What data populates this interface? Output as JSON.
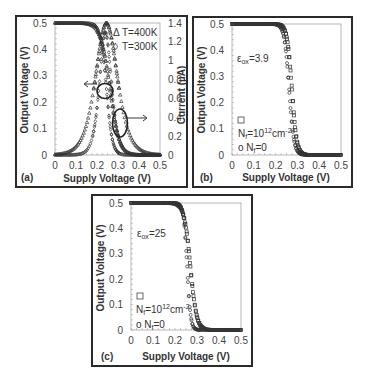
{
  "chart_data": [
    {
      "id": "a",
      "type": "line",
      "panel_label": "(a)",
      "xlabel": "Supply Voltage (V)",
      "ylabel": "Output Voltage (V)",
      "y2label": "Current (µA)",
      "xlim": [
        0,
        0.5
      ],
      "ylim": [
        0,
        0.5
      ],
      "y2lim": [
        0,
        1.4
      ],
      "xticks": [
        "0",
        "0.1",
        "0.2",
        "0.3",
        "0.4",
        "0.5"
      ],
      "yticks": [
        "0",
        "0.1",
        "0.2",
        "0.3",
        "0.4",
        "0.5"
      ],
      "y2ticks": [
        "0",
        "0.2",
        "0.4",
        "0.6",
        "0.8",
        "1",
        "1.2",
        "1.4"
      ],
      "grid": false,
      "legend": [
        {
          "marker": "Δ",
          "label": "T=400K"
        },
        {
          "marker": "◊",
          "label": "T=300K"
        }
      ],
      "annotations": [
        {
          "type": "circle",
          "target": "output voltage curves",
          "arrow": "left",
          "axis": "left"
        },
        {
          "type": "ellipse",
          "target": "current curves",
          "arrow": "right",
          "axis": "right"
        }
      ],
      "series": [
        {
          "name": "Vout T=400K",
          "axis": "left",
          "marker": "triangle",
          "kind": "sigmoid",
          "v_high": 0.5,
          "v_mid": 0.262,
          "width": 0.022
        },
        {
          "name": "Vout T=300K",
          "axis": "left",
          "marker": "diamond",
          "kind": "sigmoid",
          "v_high": 0.5,
          "v_mid": 0.245,
          "width": 0.014
        },
        {
          "name": "Current T=400K",
          "axis": "right",
          "marker": "triangle",
          "kind": "peak",
          "peak": 1.4,
          "center": 0.245,
          "width": 0.055
        },
        {
          "name": "Current T=300K",
          "axis": "right",
          "marker": "diamond",
          "kind": "peak",
          "peak": 1.3,
          "center": 0.24,
          "width": 0.03
        }
      ],
      "x": [
        0,
        0.05,
        0.1,
        0.15,
        0.2,
        0.22,
        0.24,
        0.26,
        0.28,
        0.3,
        0.35,
        0.4,
        0.45,
        0.5
      ],
      "approx_values": {
        "Vout_400K": [
          0.5,
          0.5,
          0.5,
          0.49,
          0.45,
          0.42,
          0.33,
          0.25,
          0.17,
          0.11,
          0.04,
          0.01,
          0.0,
          0.0
        ],
        "Vout_300K": [
          0.5,
          0.5,
          0.5,
          0.5,
          0.47,
          0.42,
          0.28,
          0.12,
          0.05,
          0.02,
          0.0,
          0.0,
          0.0,
          0.0
        ],
        "I_400K": [
          0.0,
          0.02,
          0.08,
          0.25,
          0.75,
          1.05,
          1.38,
          1.3,
          0.95,
          0.6,
          0.2,
          0.06,
          0.02,
          0.0
        ],
        "I_300K": [
          0.0,
          0.0,
          0.01,
          0.05,
          0.4,
          0.8,
          1.3,
          1.05,
          0.45,
          0.18,
          0.03,
          0.0,
          0.0,
          0.0
        ]
      }
    },
    {
      "id": "b",
      "type": "line",
      "panel_label": "(b)",
      "xlabel": "Supply Voltage (V)",
      "ylabel": "Output Voltage (V)",
      "xlim": [
        0,
        0.5
      ],
      "ylim": [
        0,
        0.5
      ],
      "xticks": [
        "0",
        "0.1",
        "0.2",
        "0.3",
        "0.4",
        "0.5"
      ],
      "yticks": [
        "0",
        "0.1",
        "0.2",
        "0.3",
        "0.4",
        "0.5"
      ],
      "grid": false,
      "annotation_text": "εox=3.9",
      "legend": [
        {
          "marker": "□",
          "label": "Nf=10^12cm^-2"
        },
        {
          "marker": "o",
          "label": "Nf=0"
        }
      ],
      "series": [
        {
          "name": "Nf=1e12 cm^-2",
          "marker": "square",
          "kind": "sigmoid",
          "v_high": 0.5,
          "v_mid": 0.275,
          "width": 0.011
        },
        {
          "name": "Nf=0",
          "marker": "circle",
          "kind": "sigmoid",
          "v_high": 0.5,
          "v_mid": 0.262,
          "width": 0.011
        }
      ],
      "x": [
        0,
        0.1,
        0.2,
        0.22,
        0.24,
        0.26,
        0.28,
        0.3,
        0.35,
        0.4,
        0.5
      ],
      "approx_values": {
        "Nf_1e12": [
          0.5,
          0.5,
          0.5,
          0.49,
          0.47,
          0.41,
          0.24,
          0.07,
          0.01,
          0.0,
          0.0
        ],
        "Nf_0": [
          0.5,
          0.5,
          0.5,
          0.49,
          0.45,
          0.27,
          0.1,
          0.03,
          0.0,
          0.0,
          0.0
        ]
      }
    },
    {
      "id": "c",
      "type": "line",
      "panel_label": "(c)",
      "xlabel": "Supply Voltage (V)",
      "ylabel": "Output Voltage (V)",
      "xlim": [
        0,
        0.5
      ],
      "ylim": [
        0,
        0.5
      ],
      "xticks": [
        "0",
        "0.1",
        "0.2",
        "0.3",
        "0.4",
        "0.5"
      ],
      "yticks": [
        "0",
        "0.1",
        "0.2",
        "0.3",
        "0.4",
        "0.5"
      ],
      "grid": false,
      "annotation_text": "εox=25",
      "legend": [
        {
          "marker": "□",
          "label": "Nf=10^12cm^-2"
        },
        {
          "marker": "o",
          "label": "Nf=0"
        }
      ],
      "series": [
        {
          "name": "Nf=1e12 cm^-2",
          "marker": "square",
          "kind": "sigmoid",
          "v_high": 0.5,
          "v_mid": 0.27,
          "width": 0.014
        },
        {
          "name": "Nf=0",
          "marker": "circle",
          "kind": "sigmoid",
          "v_high": 0.5,
          "v_mid": 0.255,
          "width": 0.008
        }
      ],
      "x": [
        0,
        0.1,
        0.2,
        0.22,
        0.24,
        0.26,
        0.28,
        0.3,
        0.32,
        0.35,
        0.5
      ],
      "approx_values": {
        "Nf_1e12": [
          0.5,
          0.5,
          0.5,
          0.49,
          0.47,
          0.42,
          0.3,
          0.12,
          0.04,
          0.01,
          0.0
        ],
        "Nf_0": [
          0.5,
          0.5,
          0.5,
          0.49,
          0.47,
          0.33,
          0.05,
          0.01,
          0.0,
          0.0,
          0.0
        ]
      }
    }
  ],
  "colors": {
    "frame": "#2a2a2a",
    "axis": "#555555",
    "markers": "#333333",
    "text": "#333333"
  },
  "text": {
    "legend_a_400": "T=400K",
    "legend_a_300": "T=300K",
    "eps_b": "3.9",
    "eps_c": "25",
    "nf_label_val": "=10",
    "nf_exp": "12",
    "nf_unit": "cm",
    "nf_unit_exp": "-2",
    "nf_zero": "=0"
  }
}
